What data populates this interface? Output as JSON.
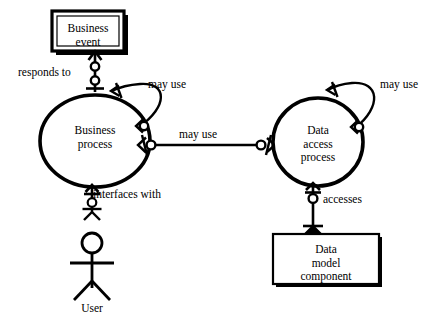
{
  "diagram": {
    "colors": {
      "stroke": "#000000",
      "background": "#ffffff",
      "shadow": "#000000"
    },
    "nodes": [
      {
        "id": "business-event",
        "shape": "double-rectangle",
        "lines": [
          "Business",
          "event"
        ]
      },
      {
        "id": "business-process",
        "shape": "ellipse",
        "lines": [
          "Business",
          "process"
        ]
      },
      {
        "id": "data-access-process",
        "shape": "ellipse",
        "lines": [
          "Data",
          "access",
          "process"
        ]
      },
      {
        "id": "data-model-component",
        "shape": "rectangle",
        "lines": [
          "Data",
          "model",
          "component"
        ]
      },
      {
        "id": "user",
        "shape": "stick-figure-actor",
        "lines": [
          "User"
        ]
      }
    ],
    "edges": [
      {
        "id": "responds-to",
        "label": "responds to",
        "from": "business-process",
        "to": "business-event"
      },
      {
        "id": "business-process-may-use-self",
        "label": "may use",
        "from": "business-process",
        "to": "business-process"
      },
      {
        "id": "business-process-may-use-data-access",
        "label": "may use",
        "from": "business-process",
        "to": "data-access-process"
      },
      {
        "id": "data-access-may-use-self",
        "label": "may use",
        "from": "data-access-process",
        "to": "data-access-process"
      },
      {
        "id": "accesses",
        "label": "accesses",
        "from": "data-access-process",
        "to": "data-model-component"
      },
      {
        "id": "interfaces-with",
        "label": "interfaces with",
        "from": "business-process",
        "to": "user"
      }
    ]
  }
}
